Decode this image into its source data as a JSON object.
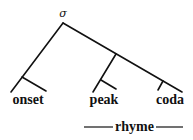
{
  "diagram": {
    "type": "syllable-tree",
    "root": {
      "label": "σ"
    },
    "nodes": [
      {
        "id": "onset",
        "label": "onset"
      },
      {
        "id": "peak",
        "label": "peak"
      },
      {
        "id": "coda",
        "label": "coda"
      }
    ],
    "bracket": {
      "label": "rhyme",
      "spans": [
        "peak",
        "coda"
      ]
    }
  }
}
